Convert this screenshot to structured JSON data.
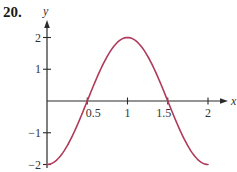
{
  "problem_number": "20.",
  "colors": {
    "curve": "#b03a5b",
    "axis": "#2a2a2a",
    "text": "#333333"
  },
  "chart_data": {
    "type": "line",
    "title": "",
    "function": "y = -2cos(πx)",
    "xlabel": "x",
    "ylabel": "y",
    "xlim": [
      0,
      2
    ],
    "ylim": [
      -2,
      2
    ],
    "grid": false,
    "legend": null,
    "x_ticks": [
      0.5,
      1,
      1.5,
      2
    ],
    "x_tick_labels": [
      "0.5",
      "1",
      "1.5",
      "2"
    ],
    "y_ticks": [
      2,
      1,
      -1,
      -2
    ],
    "y_tick_labels": [
      "2",
      "1",
      "−1",
      "−2"
    ],
    "series": [
      {
        "name": "curve",
        "x": [
          0,
          0.125,
          0.25,
          0.375,
          0.5,
          0.625,
          0.75,
          0.875,
          1,
          1.125,
          1.25,
          1.375,
          1.5,
          1.625,
          1.75,
          1.875,
          2
        ],
        "y": [
          -2,
          -1.85,
          -1.41,
          -0.77,
          0,
          0.77,
          1.41,
          1.85,
          2,
          1.85,
          1.41,
          0.77,
          0,
          -0.77,
          -1.41,
          -1.85,
          -2
        ]
      }
    ]
  }
}
